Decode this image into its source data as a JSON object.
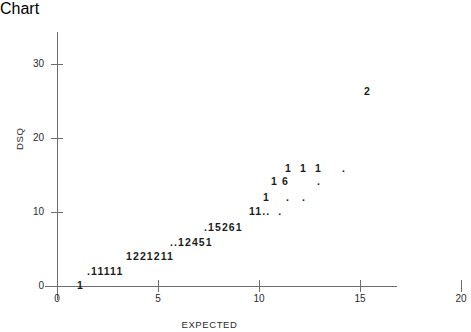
{
  "chart_data": {
    "type": "scatter",
    "title": "",
    "xlabel": "EXPECTED",
    "ylabel": "DSQ",
    "xlim": [
      0,
      20
    ],
    "ylim": [
      0,
      30
    ],
    "xticks": [
      0,
      5,
      10,
      15,
      20
    ],
    "yticks": [
      0,
      10,
      20,
      30
    ],
    "grid": false,
    "legend": null,
    "rows": [
      {
        "text": "2",
        "x": 15.2,
        "y": 26.3
      },
      {
        "text": "1  1  1     .",
        "x": 11.3,
        "y": 15.9
      },
      {
        "text": "1 6       .",
        "x": 10.6,
        "y": 14.2
      },
      {
        "text": "1    .   .",
        "x": 10.2,
        "y": 12.0
      },
      {
        "text": "11..  .",
        "x": 9.5,
        "y": 10.2
      },
      {
        "text": ".15261",
        "x": 7.3,
        "y": 8.0
      },
      {
        "text": "..12451",
        "x": 5.6,
        "y": 6.0
      },
      {
        "text": "1221211",
        "x": 3.4,
        "y": 4.1
      },
      {
        "text": ".11111",
        "x": 1.5,
        "y": 2.0
      },
      {
        "text": "1",
        "x": 1.0,
        "y": 0.2
      }
    ],
    "points": [
      {
        "x": 15.2,
        "y": 26.3,
        "count": 2
      },
      {
        "x": 11.4,
        "y": 15.9,
        "count": 1
      },
      {
        "x": 12.4,
        "y": 15.9,
        "count": 1
      },
      {
        "x": 13.3,
        "y": 15.9,
        "count": 1
      },
      {
        "x": 15.4,
        "y": 15.9,
        "count": 1
      },
      {
        "x": 10.6,
        "y": 14.2,
        "count": 1
      },
      {
        "x": 11.2,
        "y": 14.2,
        "count": 6
      },
      {
        "x": 13.6,
        "y": 14.0,
        "count": 1
      },
      {
        "x": 10.3,
        "y": 12.0,
        "count": 1
      },
      {
        "x": 11.6,
        "y": 11.9,
        "count": 1
      },
      {
        "x": 12.5,
        "y": 11.9,
        "count": 1
      },
      {
        "x": 9.6,
        "y": 10.2,
        "count": 1
      },
      {
        "x": 10.0,
        "y": 10.2,
        "count": 1
      },
      {
        "x": 10.4,
        "y": 10.1,
        "count": 1
      },
      {
        "x": 10.8,
        "y": 10.1,
        "count": 1
      },
      {
        "x": 11.5,
        "y": 10.1,
        "count": 1
      },
      {
        "x": 7.4,
        "y": 8.0,
        "count": 1
      },
      {
        "x": 7.8,
        "y": 8.0,
        "count": 1
      },
      {
        "x": 8.2,
        "y": 8.0,
        "count": 5
      },
      {
        "x": 8.6,
        "y": 8.0,
        "count": 2
      },
      {
        "x": 9.0,
        "y": 8.0,
        "count": 6
      },
      {
        "x": 9.4,
        "y": 8.0,
        "count": 1
      },
      {
        "x": 5.7,
        "y": 6.0,
        "count": 1
      },
      {
        "x": 6.1,
        "y": 6.0,
        "count": 1
      },
      {
        "x": 6.5,
        "y": 6.0,
        "count": 1
      },
      {
        "x": 6.9,
        "y": 6.0,
        "count": 2
      },
      {
        "x": 7.3,
        "y": 6.0,
        "count": 4
      },
      {
        "x": 7.7,
        "y": 6.0,
        "count": 5
      },
      {
        "x": 8.1,
        "y": 6.0,
        "count": 1
      },
      {
        "x": 3.5,
        "y": 4.1,
        "count": 1
      },
      {
        "x": 3.9,
        "y": 4.1,
        "count": 2
      },
      {
        "x": 4.3,
        "y": 4.1,
        "count": 2
      },
      {
        "x": 4.7,
        "y": 4.1,
        "count": 1
      },
      {
        "x": 5.1,
        "y": 4.1,
        "count": 2
      },
      {
        "x": 5.5,
        "y": 4.1,
        "count": 1
      },
      {
        "x": 5.9,
        "y": 4.1,
        "count": 1
      },
      {
        "x": 1.6,
        "y": 2.0,
        "count": 1
      },
      {
        "x": 2.0,
        "y": 2.0,
        "count": 1
      },
      {
        "x": 2.4,
        "y": 2.0,
        "count": 1
      },
      {
        "x": 2.8,
        "y": 2.0,
        "count": 1
      },
      {
        "x": 3.2,
        "y": 2.0,
        "count": 1
      },
      {
        "x": 3.6,
        "y": 2.0,
        "count": 1
      },
      {
        "x": 1.0,
        "y": 0.2,
        "count": 1
      }
    ]
  },
  "axes": {
    "x_title": "EXPECTED",
    "y_title": "DSQ",
    "x_tick_labels": [
      "0",
      "5",
      "10",
      "15",
      "20"
    ],
    "y_tick_labels": [
      "0",
      "10",
      "20",
      "30"
    ]
  },
  "colors": {
    "axis": "#6d6d6d",
    "text": "#2b2b2b",
    "marker": "#1c1c1c",
    "background": "#ffffff"
  }
}
